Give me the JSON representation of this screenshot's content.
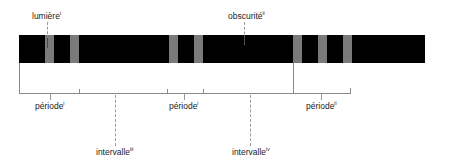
{
  "diagram": {
    "type": "timing-diagram",
    "colors": {
      "dark": "#000000",
      "light_pulse": "#7a7a7a",
      "lines": "#8a8a8a",
      "text": "#222222"
    },
    "labels": {
      "light": {
        "text": "lumière",
        "sup": "i"
      },
      "dark": {
        "text": "obscurité",
        "sup": "ii"
      },
      "period_1": {
        "text": "période",
        "sup": "i"
      },
      "period_2": {
        "text": "période",
        "sup": "i"
      },
      "period_3": {
        "text": "période",
        "sup": "ii"
      },
      "interval_1": {
        "text": "intervalle",
        "sup": "iii"
      },
      "interval_2": {
        "text": "intervalle",
        "sup": "iv"
      }
    }
  }
}
